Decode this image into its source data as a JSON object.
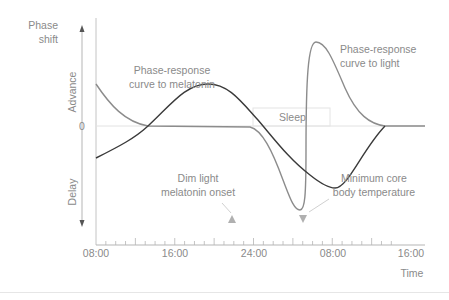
{
  "y_axis": {
    "title_line1": "Phase",
    "title_line2": "shift",
    "advance_label": "Advance",
    "delay_label": "Delay",
    "zero_label": "0"
  },
  "x_axis": {
    "title": "Time",
    "tick_labels": [
      "08:00",
      "16:00",
      "24:00",
      "08:00",
      "16:00"
    ]
  },
  "annotations": {
    "melatonin_curve_line1": "Phase-response",
    "melatonin_curve_line2": "curve to melatonin",
    "light_curve_line1": "Phase-response",
    "light_curve_line2": "curve to light",
    "sleep": "Sleep",
    "dlmo_line1": "Dim light",
    "dlmo_line2": "melatonin onset",
    "cbt_line1": "Minimum core",
    "cbt_line2": "body temperature"
  },
  "colors": {
    "light_curve": "#8c8c8c",
    "melatonin_curve": "#3a3a3a",
    "axis": "#b5b5b5",
    "text": "#8a8a8a",
    "marker": "#b0b0b0"
  }
}
